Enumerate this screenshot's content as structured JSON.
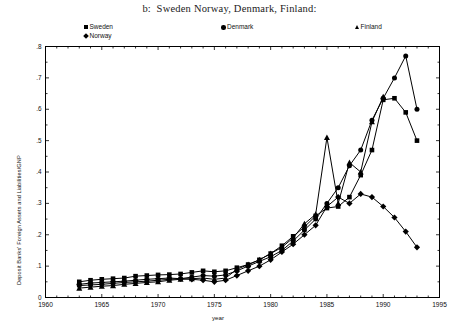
{
  "figure": {
    "title": "b:  Sweden Norway, Denmark, Finland:"
  },
  "legend": {
    "position": "above-plot",
    "entries": [
      {
        "label": "Sweden",
        "marker": "square-marker-icon"
      },
      {
        "label": "Norway",
        "marker": "diamond-marker-icon"
      },
      {
        "label": "Denmark",
        "marker": "circle-marker-icon"
      },
      {
        "label": "Finland",
        "marker": "triangle-marker-icon"
      }
    ]
  },
  "axes": {
    "x_title": "year",
    "y_title": "Deposit Banks' Foreign Assets and Liabilities/GNP",
    "x_ticks": [
      "1960",
      "1965",
      "1970",
      "1975",
      "1980",
      "1985",
      "1990",
      "1995"
    ],
    "y_ticks": [
      "0",
      ".1",
      ".2",
      ".3",
      ".4",
      ".5",
      ".6",
      ".7",
      ".8"
    ]
  },
  "chart_data": {
    "type": "line",
    "title": "b:  Sweden Norway, Denmark, Finland:",
    "xlabel": "year",
    "ylabel": "Deposit Banks' Foreign Assets and Liabilities/GNP",
    "xlim": [
      1960,
      1995
    ],
    "ylim": [
      0,
      0.8
    ],
    "xtick_values": [
      1960,
      1965,
      1970,
      1975,
      1980,
      1985,
      1990,
      1995
    ],
    "ytick_values": [
      0,
      0.1,
      0.2,
      0.3,
      0.4,
      0.5,
      0.6,
      0.7,
      0.8
    ],
    "grid": false,
    "legend_position": "above plot, horizontal",
    "series": [
      {
        "name": "Sweden",
        "marker": "square",
        "x": [
          1963,
          1964,
          1965,
          1966,
          1967,
          1968,
          1969,
          1970,
          1971,
          1972,
          1973,
          1974,
          1975,
          1976,
          1977,
          1978,
          1979,
          1980,
          1981,
          1982,
          1983,
          1984,
          1985,
          1986,
          1987,
          1988,
          1989,
          1990,
          1991,
          1992,
          1993
        ],
        "y": [
          0.05,
          0.055,
          0.058,
          0.06,
          0.062,
          0.068,
          0.07,
          0.072,
          0.073,
          0.075,
          0.08,
          0.085,
          0.082,
          0.085,
          0.095,
          0.105,
          0.12,
          0.14,
          0.165,
          0.195,
          0.225,
          0.26,
          0.285,
          0.29,
          0.32,
          0.39,
          0.47,
          0.63,
          0.635,
          0.59,
          0.5
        ]
      },
      {
        "name": "Norway",
        "marker": "diamond",
        "x": [
          1963,
          1964,
          1965,
          1966,
          1967,
          1968,
          1969,
          1970,
          1971,
          1972,
          1973,
          1974,
          1975,
          1976,
          1977,
          1978,
          1979,
          1980,
          1981,
          1982,
          1983,
          1984,
          1985,
          1986,
          1987,
          1988,
          1989,
          1990,
          1991,
          1992,
          1993
        ],
        "y": [
          0.042,
          0.046,
          0.048,
          0.05,
          0.052,
          0.055,
          0.058,
          0.06,
          0.062,
          0.06,
          0.058,
          0.055,
          0.05,
          0.055,
          0.07,
          0.085,
          0.1,
          0.12,
          0.145,
          0.17,
          0.2,
          0.23,
          0.29,
          0.32,
          0.3,
          0.33,
          0.32,
          0.29,
          0.255,
          0.21,
          0.16
        ]
      },
      {
        "name": "Denmark",
        "marker": "circle",
        "x": [
          1963,
          1964,
          1965,
          1966,
          1967,
          1968,
          1969,
          1970,
          1971,
          1972,
          1973,
          1974,
          1975,
          1976,
          1977,
          1978,
          1979,
          1980,
          1981,
          1982,
          1983,
          1984,
          1985,
          1986,
          1987,
          1988,
          1989,
          1990,
          1991,
          1992,
          1993
        ],
        "y": [
          0.038,
          0.04,
          0.042,
          0.045,
          0.048,
          0.05,
          0.052,
          0.055,
          0.058,
          0.06,
          0.065,
          0.07,
          0.068,
          0.072,
          0.085,
          0.1,
          0.115,
          0.13,
          0.15,
          0.18,
          0.215,
          0.25,
          0.3,
          0.35,
          0.42,
          0.47,
          0.565,
          0.635,
          0.7,
          0.77,
          0.6
        ]
      },
      {
        "name": "Finland",
        "marker": "triangle",
        "x": [
          1963,
          1964,
          1965,
          1966,
          1967,
          1968,
          1969,
          1970,
          1971,
          1972,
          1973,
          1974,
          1975,
          1976,
          1977,
          1978,
          1979,
          1980,
          1981,
          1982,
          1983,
          1984,
          1985,
          1986,
          1987,
          1988,
          1989,
          1990
        ],
        "y": [
          0.03,
          0.033,
          0.036,
          0.038,
          0.042,
          0.045,
          0.048,
          0.05,
          0.055,
          0.058,
          0.06,
          0.062,
          0.058,
          0.062,
          0.09,
          0.105,
          0.12,
          0.14,
          0.16,
          0.19,
          0.235,
          0.265,
          0.51,
          0.3,
          0.43,
          0.4,
          0.56,
          0.64
        ]
      }
    ]
  }
}
